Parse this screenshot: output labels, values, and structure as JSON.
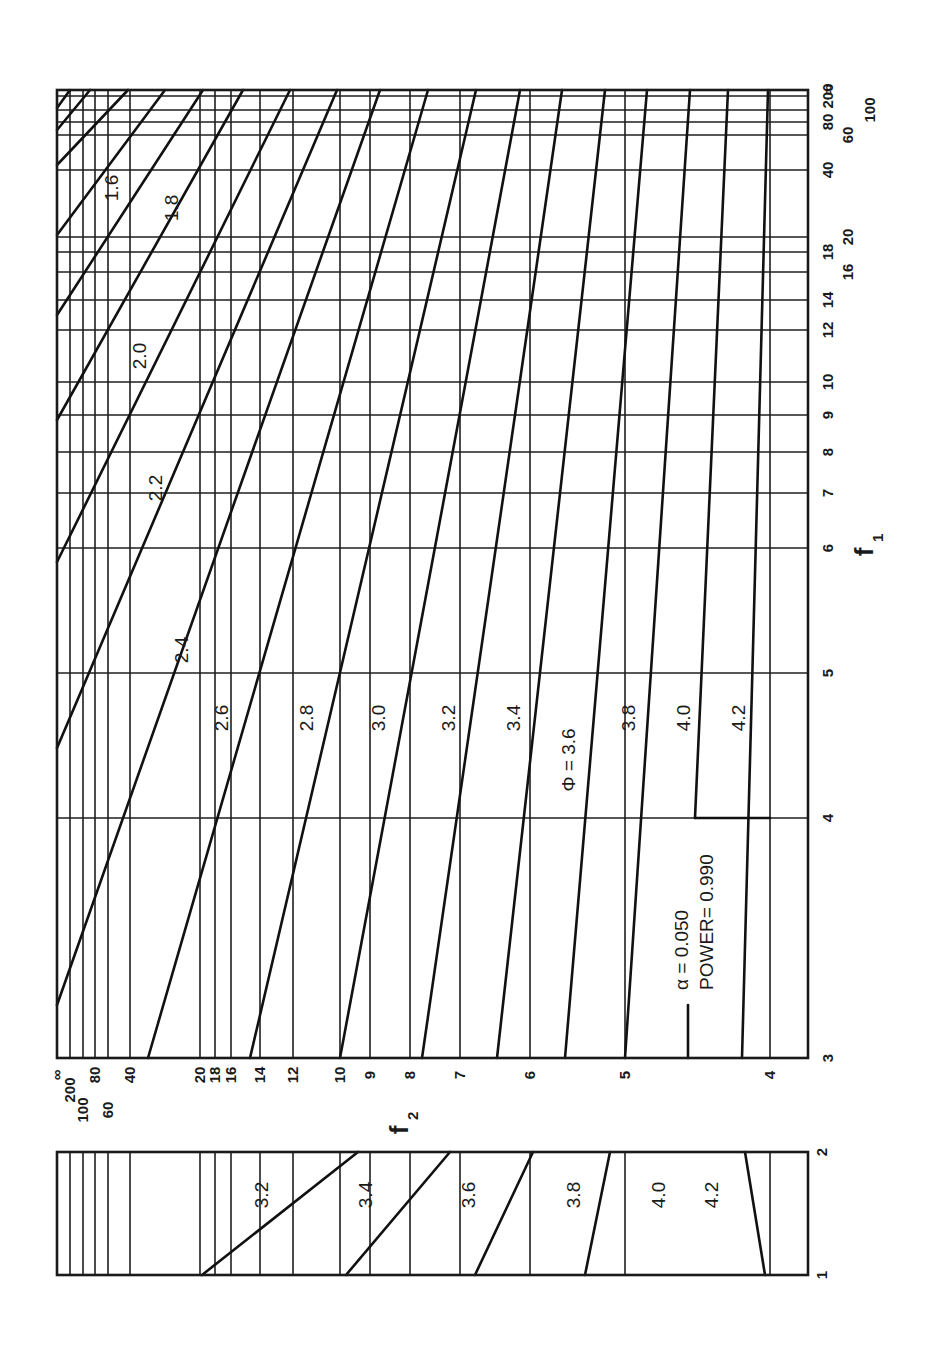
{
  "chart_data": {
    "type": "line",
    "parameters": {
      "alpha_label": "α  = 0.050",
      "power_label": "POWER= 0.990",
      "alpha": 0.05,
      "power": 0.99
    },
    "orientation": "rotated 90° counter-clockwise (f1 axis runs along right edge, f2 axis along bottom edge)",
    "xlabel": "f1",
    "ylabel": "f2",
    "phi_label": "Φ = 3.6",
    "main_panel": {
      "f1_range": [
        3,
        "∞"
      ],
      "f2_range": [
        4,
        "∞"
      ],
      "f1_ticks": [
        "3",
        "4",
        "5",
        "6",
        "7",
        "8",
        "9",
        "10",
        "12",
        "14",
        "16",
        "18",
        "20",
        "40",
        "60",
        "80",
        "100",
        "200",
        "∞"
      ],
      "f2_ticks": [
        "4",
        "5",
        "6",
        "7",
        "8",
        "9",
        "10",
        "12",
        "14",
        "16",
        "18",
        "20",
        "40",
        "60",
        "80",
        "100",
        "200",
        "∞"
      ],
      "series": [
        {
          "name": "1.6",
          "f2_at_f1_inf": 200,
          "note": "upper-left corner"
        },
        {
          "name": "1.8",
          "f2_at_f1_inf": 60
        },
        {
          "name": "2.0",
          "f2_at_f1_inf": 40
        },
        {
          "name": "2.2",
          "f2_at_f1_inf": 20
        },
        {
          "name": "2.4",
          "f2_at_f1_inf": 14
        },
        {
          "name": "2.6",
          "f2_at_f1_inf": 12
        },
        {
          "name": "2.8",
          "f2_at_f1_inf": 10
        },
        {
          "name": "3.0",
          "f2_at_f1_inf": 9
        },
        {
          "name": "3.2",
          "f2_at_f1_inf": 8,
          "f2_at_f1_3": 12
        },
        {
          "name": "3.4",
          "f2_at_f1_inf": 7,
          "f2_at_f1_3": 10
        },
        {
          "name": "3.6",
          "f2_at_f1_inf": 6,
          "f2_at_f1_3": 8
        },
        {
          "name": "3.8",
          "f2_at_f1_inf": 5.3,
          "f2_at_f1_3": 6.3
        },
        {
          "name": "4.0",
          "f2_at_f1_inf": 4.8,
          "f2_at_f1_4": 5.0
        },
        {
          "name": "4.2",
          "f2_at_f1_inf": 4.3,
          "f2_at_f1_3": 4.4
        }
      ]
    },
    "inset_panel": {
      "f1_range": [
        1,
        2
      ],
      "f1_ticks": [
        "1",
        "2"
      ],
      "series": [
        {
          "name": "3.2",
          "f2_at_f1_1": 16,
          "f2_at_f1_2": 10
        },
        {
          "name": "3.4",
          "f2_at_f1_1": 10,
          "f2_at_f1_2": 7.6
        },
        {
          "name": "3.6",
          "f2_at_f1_1": 7.3,
          "f2_at_f1_2": 6.2
        },
        {
          "name": "3.8",
          "f2_at_f1_1": 5.6,
          "f2_at_f1_2": 5.3
        },
        {
          "name": "4.0",
          "f2_at_f1_1": 4.9,
          "f2_at_f1_2": 4.9
        },
        {
          "name": "4.2",
          "f2_at_f1_1": 4.0,
          "f2_at_f1_2": 4.2
        }
      ]
    },
    "grid": true,
    "legend": "none (curves labelled inline by Φ value)"
  },
  "layout": {
    "main": {
      "left": 57,
      "right": 808,
      "top": 90,
      "bottom": 1058
    },
    "inset": {
      "left": 57,
      "right": 808,
      "top": 1152,
      "bottom": 1275
    },
    "f2_positions": [
      {
        "label": "∞",
        "x": 57
      },
      {
        "label": "200",
        "x": 70
      },
      {
        "label": "100",
        "x": 83
      },
      {
        "label": "80",
        "x": 95
      },
      {
        "label": "60",
        "x": 108
      },
      {
        "label": "40",
        "x": 130
      },
      {
        "label": "20",
        "x": 200
      },
      {
        "label": "18",
        "x": 215
      },
      {
        "label": "16",
        "x": 231
      },
      {
        "label": "14",
        "x": 260
      },
      {
        "label": "12",
        "x": 293
      },
      {
        "label": "10",
        "x": 340
      },
      {
        "label": "9",
        "x": 370
      },
      {
        "label": "8",
        "x": 410
      },
      {
        "label": "7",
        "x": 460
      },
      {
        "label": "6",
        "x": 530
      },
      {
        "label": "5",
        "x": 625
      },
      {
        "label": "4",
        "x": 770
      }
    ],
    "f1_positions": [
      {
        "label": "3",
        "y": 1058
      },
      {
        "label": "4",
        "y": 818
      },
      {
        "label": "5",
        "y": 673
      },
      {
        "label": "6",
        "y": 548
      },
      {
        "label": "7",
        "y": 493
      },
      {
        "label": "8",
        "y": 452
      },
      {
        "label": "9",
        "y": 415
      },
      {
        "label": "10",
        "y": 382
      },
      {
        "label": "12",
        "y": 330
      },
      {
        "label": "14",
        "y": 300
      },
      {
        "label": "16",
        "y": 272
      },
      {
        "label": "18",
        "y": 252
      },
      {
        "label": "20",
        "y": 237
      },
      {
        "label": "40",
        "y": 170
      },
      {
        "label": "60",
        "y": 135
      },
      {
        "label": "80",
        "y": 122
      },
      {
        "label": "100",
        "y": 110
      },
      {
        "label": "200",
        "y": 96
      },
      {
        "label": "∞",
        "y": 90
      }
    ],
    "inset_f1_positions": [
      {
        "label": "1",
        "y": 1275
      },
      {
        "label": "2",
        "y": 1152
      }
    ],
    "main_curves": [
      {
        "label": "1.6",
        "pts": [
          [
            70,
            90
          ],
          [
            57,
            108
          ]
        ],
        "lx": 118,
        "ly": 188
      },
      {
        "label": "1.6b",
        "pts": [
          [
            90,
            90
          ],
          [
            57,
            130
          ]
        ]
      },
      {
        "label": "1.8",
        "pts": [
          [
            128,
            90
          ],
          [
            57,
            165
          ]
        ],
        "lx": 178,
        "ly": 208
      },
      {
        "label": "2.0",
        "pts": [
          [
            165,
            90
          ],
          [
            57,
            235
          ]
        ],
        "lx": 146,
        "ly": 356
      },
      {
        "label": "2.0b",
        "pts": [
          [
            203,
            90
          ],
          [
            57,
            315
          ]
        ]
      },
      {
        "label": "2.2",
        "pts": [
          [
            243,
            90
          ],
          [
            57,
            420
          ]
        ],
        "lx": 162,
        "ly": 488
      },
      {
        "label": "2.4",
        "pts": [
          [
            290,
            90
          ],
          [
            57,
            562
          ]
        ],
        "lx": 188,
        "ly": 650
      },
      {
        "label": "2.6",
        "pts": [
          [
            337,
            90
          ],
          [
            57,
            748
          ]
        ],
        "lx": 228,
        "ly": 718
      },
      {
        "label": "2.8",
        "pts": [
          [
            380,
            90
          ],
          [
            57,
            1005
          ]
        ],
        "lx": 313,
        "ly": 718
      },
      {
        "label": "3.0",
        "pts": [
          [
            428,
            90
          ],
          [
            148,
            1058
          ]
        ],
        "lx": 385,
        "ly": 718
      },
      {
        "label": "3.2",
        "pts": [
          [
            476,
            90
          ],
          [
            250,
            1058
          ]
        ],
        "lx": 455,
        "ly": 718
      },
      {
        "label": "3.4",
        "pts": [
          [
            520,
            90
          ],
          [
            340,
            1058
          ]
        ],
        "lx": 520,
        "ly": 718
      },
      {
        "label": "3.6",
        "pts": [
          [
            562,
            90
          ],
          [
            422,
            1058
          ]
        ],
        "lx": 575,
        "ly": 760
      },
      {
        "label": "3.8",
        "pts": [
          [
            605,
            90
          ],
          [
            497,
            1058
          ]
        ],
        "lx": 635,
        "ly": 718
      },
      {
        "label": "4.0",
        "pts": [
          [
            647,
            90
          ],
          [
            565,
            1058
          ]
        ],
        "lx": 690,
        "ly": 718
      },
      {
        "label": "4.2",
        "pts": [
          [
            690,
            90
          ],
          [
            625,
            1058
          ]
        ],
        "lx": 745,
        "ly": 718
      },
      {
        "label": "4.4",
        "pts": [
          [
            728,
            90
          ],
          [
            695,
            818
          ]
        ]
      },
      {
        "label": "4.6",
        "pts": [
          [
            768,
            90
          ],
          [
            742,
            1058
          ]
        ]
      }
    ],
    "inset_curves": [
      {
        "label": "3.2",
        "pts": [
          [
            202,
            1275
          ],
          [
            358,
            1152
          ]
        ],
        "lx": 268,
        "ly": 1195
      },
      {
        "label": "3.4",
        "pts": [
          [
            346,
            1275
          ],
          [
            450,
            1152
          ]
        ],
        "lx": 372,
        "ly": 1195
      },
      {
        "label": "3.6",
        "pts": [
          [
            475,
            1275
          ],
          [
            533,
            1152
          ]
        ],
        "lx": 475,
        "ly": 1195
      },
      {
        "label": "3.8",
        "pts": [
          [
            585,
            1275
          ],
          [
            610,
            1152
          ]
        ],
        "lx": 580,
        "ly": 1195
      },
      {
        "label": "4.0",
        "pts": [],
        "lx": 665,
        "ly": 1195
      },
      {
        "label": "4.2",
        "pts": [
          [
            765,
            1275
          ],
          [
            745,
            1152
          ]
        ],
        "lx": 718,
        "ly": 1195
      }
    ],
    "extra_ticks": [
      {
        "x1": 688,
        "y1": 1058,
        "x2": 688,
        "y2": 1005
      },
      {
        "x1": 695,
        "y1": 818,
        "x2": 770,
        "y2": 818
      }
    ]
  },
  "labels": {
    "f1_title": "f",
    "f1_sub": "1",
    "f2_title": "f",
    "f2_sub": "2",
    "alpha": "α  = 0.050",
    "power": "POWER= 0.990",
    "phi": "Φ = 3.6",
    "curve_labels_main": [
      "1.6",
      "1.8",
      "2.0",
      "2.2",
      "2.4",
      "2.6",
      "2.8",
      "3.0",
      "3.2",
      "3.4",
      "Φ = 3.6",
      "3.8",
      "4.0",
      "4.2"
    ],
    "curve_labels_inset": [
      "3.2",
      "3.4",
      "3.6",
      "3.8",
      "4.0",
      "4.2"
    ]
  }
}
